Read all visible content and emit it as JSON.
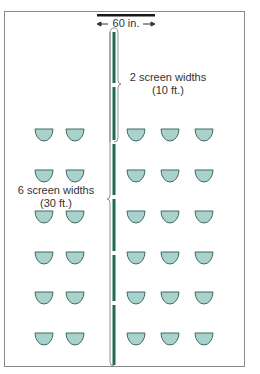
{
  "diagram": {
    "screen_width_label": "60 in.",
    "near_label": {
      "line1": "2 screen widths",
      "line2": "(10 ft.)"
    },
    "far_label": {
      "line1": "6 screen widths",
      "line2": "(30 ft.)"
    },
    "colors": {
      "frame": "#8a8a8a",
      "screen_bar": "#1a1a1a",
      "aisle_line": "#1e6b57",
      "seat_fill": "#a9d2cc",
      "seat_stroke": "#3f6b63",
      "brace": "#777777"
    },
    "seating": {
      "rows": 6,
      "left_columns": 2,
      "right_columns": 3
    }
  }
}
